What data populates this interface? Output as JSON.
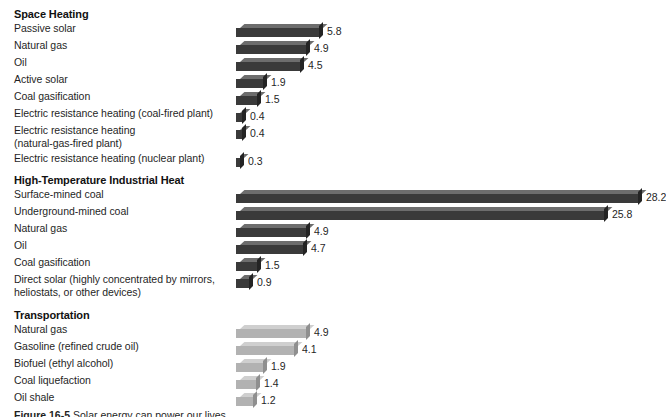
{
  "figure": {
    "caption_prefix": "Figure 16-5",
    "caption_text": "Solar energy can power our lives"
  },
  "chart_data": {
    "type": "bar",
    "orientation": "horizontal",
    "title": "",
    "xlabel": "",
    "ylabel": "",
    "xlim": [
      0,
      28.2
    ],
    "grid": false,
    "legend": null,
    "px_per_unit": 14.25,
    "groups": [
      {
        "name": "Space Heating",
        "style": "dark",
        "categories": [
          "Passive solar",
          "Natural gas",
          "Oil",
          "Active solar",
          "Coal gasification",
          "Electric resistance heating (coal-fired plant)",
          "Electric resistance heating\n(natural-gas-fired plant)",
          "Electric resistance heating (nuclear plant)"
        ],
        "values": [
          5.8,
          4.9,
          4.5,
          1.9,
          1.5,
          0.4,
          0.4,
          0.3
        ],
        "labels": [
          "5.8",
          "4.9",
          "4.5",
          "1.9",
          "1.5",
          "0.4",
          "0.4",
          "0.3"
        ]
      },
      {
        "name": "High-Temperature Industrial Heat",
        "style": "dark",
        "categories": [
          "Surface-mined coal",
          "Underground-mined coal",
          "Natural gas",
          "Oil",
          "Coal gasification",
          "Direct solar (highly concentrated by mirrors,\nheliostats, or other devices)"
        ],
        "values": [
          28.2,
          25.8,
          4.9,
          4.7,
          1.5,
          0.9
        ],
        "labels": [
          "28.2",
          "25.8",
          "4.9",
          "4.7",
          "1.5",
          "0.9"
        ]
      },
      {
        "name": "Transportation",
        "style": "light",
        "categories": [
          "Natural gas",
          "Gasoline (refined crude oil)",
          "Biofuel (ethyl alcohol)",
          "Coal liquefaction",
          "Oil shale"
        ],
        "values": [
          4.9,
          4.1,
          1.9,
          1.4,
          1.2
        ],
        "labels": [
          "4.9",
          "4.1",
          "1.9",
          "1.4",
          "1.2"
        ]
      }
    ]
  },
  "colors": {
    "bar_dark_face": "#3a3a3a",
    "bar_dark_top": "#6d6d6d",
    "bar_dark_side": "#242424",
    "bar_light_face": "#b2b2b2",
    "bar_light_top": "#cfcfcf",
    "bar_light_side": "#8f8f8f",
    "text": "#1f1f1f",
    "background": "#ffffff"
  },
  "layout": {
    "section_tops": [
      8,
      174,
      309
    ],
    "row_pitch": 17,
    "two_line_extra": 11,
    "bar_origin_x": 236
  }
}
